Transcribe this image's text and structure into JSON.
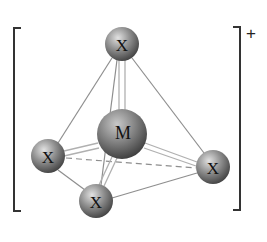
{
  "diagram": {
    "type": "tetrahedral-complex-ion",
    "charge": "+",
    "central_atom": {
      "label": "M",
      "x": 122,
      "y": 134,
      "r": 25
    },
    "ligands": [
      {
        "id": "top",
        "label": "X",
        "x": 122,
        "y": 44,
        "r": 17
      },
      {
        "id": "left",
        "label": "X",
        "x": 48,
        "y": 156,
        "r": 17
      },
      {
        "id": "right",
        "label": "X",
        "x": 213,
        "y": 167,
        "r": 17
      },
      {
        "id": "bottom",
        "label": "X",
        "x": 96,
        "y": 201,
        "r": 17
      }
    ],
    "colors": {
      "atom_light": "#d8d8d8",
      "atom_mid": "#8a8a8a",
      "atom_dark": "#3c3c3c",
      "edge": "#8a8a8a",
      "bond": "#b5b5b5",
      "bracket": "#333333"
    }
  }
}
